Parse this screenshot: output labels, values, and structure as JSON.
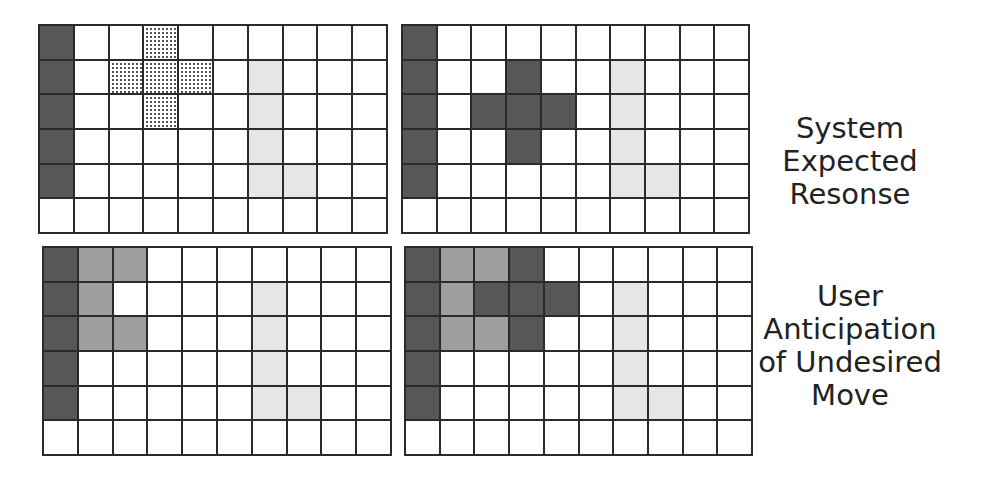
{
  "colors": {
    "grid_line": "#2a2a2a",
    "dark": "#575757",
    "medium": "#9e9e9e",
    "light": "#e6e6e6",
    "empty": "#ffffff"
  },
  "grid_size": {
    "cols": 10,
    "rows": 6
  },
  "grids": [
    {
      "id": "top-left",
      "description": "Initial state with dotted plus (expected target)",
      "cells": [
        [
          "dark",
          "empty",
          "empty",
          "dotted",
          "empty",
          "empty",
          "empty",
          "empty",
          "empty",
          "empty"
        ],
        [
          "dark",
          "empty",
          "dotted",
          "dotted",
          "dotted",
          "empty",
          "light",
          "empty",
          "empty",
          "empty"
        ],
        [
          "dark",
          "empty",
          "empty",
          "dotted",
          "empty",
          "empty",
          "light",
          "empty",
          "empty",
          "empty"
        ],
        [
          "dark",
          "empty",
          "empty",
          "empty",
          "empty",
          "empty",
          "light",
          "empty",
          "empty",
          "empty"
        ],
        [
          "dark",
          "empty",
          "empty",
          "empty",
          "empty",
          "empty",
          "light",
          "light",
          "empty",
          "empty"
        ],
        [
          "empty",
          "empty",
          "empty",
          "empty",
          "empty",
          "empty",
          "empty",
          "empty",
          "empty",
          "empty"
        ]
      ]
    },
    {
      "id": "top-right",
      "description": "System expected response: dark plus placed",
      "cells": [
        [
          "dark",
          "empty",
          "empty",
          "empty",
          "empty",
          "empty",
          "empty",
          "empty",
          "empty",
          "empty"
        ],
        [
          "dark",
          "empty",
          "empty",
          "dark",
          "empty",
          "empty",
          "light",
          "empty",
          "empty",
          "empty"
        ],
        [
          "dark",
          "empty",
          "dark",
          "dark",
          "dark",
          "empty",
          "light",
          "empty",
          "empty",
          "empty"
        ],
        [
          "dark",
          "empty",
          "empty",
          "dark",
          "empty",
          "empty",
          "light",
          "empty",
          "empty",
          "empty"
        ],
        [
          "dark",
          "empty",
          "empty",
          "empty",
          "empty",
          "empty",
          "light",
          "light",
          "empty",
          "empty"
        ],
        [
          "empty",
          "empty",
          "empty",
          "empty",
          "empty",
          "empty",
          "empty",
          "empty",
          "empty",
          "empty"
        ]
      ]
    },
    {
      "id": "bottom-left",
      "description": "User anticipation: medium cells near left column",
      "cells": [
        [
          "dark",
          "medium",
          "medium",
          "empty",
          "empty",
          "empty",
          "empty",
          "empty",
          "empty",
          "empty"
        ],
        [
          "dark",
          "medium",
          "empty",
          "empty",
          "empty",
          "empty",
          "light",
          "empty",
          "empty",
          "empty"
        ],
        [
          "dark",
          "medium",
          "medium",
          "empty",
          "empty",
          "empty",
          "light",
          "empty",
          "empty",
          "empty"
        ],
        [
          "dark",
          "empty",
          "empty",
          "empty",
          "empty",
          "empty",
          "light",
          "empty",
          "empty",
          "empty"
        ],
        [
          "dark",
          "empty",
          "empty",
          "empty",
          "empty",
          "empty",
          "light",
          "light",
          "empty",
          "empty"
        ],
        [
          "empty",
          "empty",
          "empty",
          "empty",
          "empty",
          "empty",
          "empty",
          "empty",
          "empty",
          "empty"
        ]
      ]
    },
    {
      "id": "bottom-right",
      "description": "Undesired move: plus merged with medium cells",
      "cells": [
        [
          "dark",
          "medium",
          "medium",
          "dark",
          "empty",
          "empty",
          "empty",
          "empty",
          "empty",
          "empty"
        ],
        [
          "dark",
          "medium",
          "dark",
          "dark",
          "dark",
          "empty",
          "light",
          "empty",
          "empty",
          "empty"
        ],
        [
          "dark",
          "medium",
          "medium",
          "dark",
          "empty",
          "empty",
          "light",
          "empty",
          "empty",
          "empty"
        ],
        [
          "dark",
          "empty",
          "empty",
          "empty",
          "empty",
          "empty",
          "light",
          "empty",
          "empty",
          "empty"
        ],
        [
          "dark",
          "empty",
          "empty",
          "empty",
          "empty",
          "empty",
          "light",
          "light",
          "empty",
          "empty"
        ],
        [
          "empty",
          "empty",
          "empty",
          "empty",
          "empty",
          "empty",
          "empty",
          "empty",
          "empty",
          "empty"
        ]
      ]
    }
  ],
  "labels": {
    "top": [
      "System",
      "Expected",
      "Resonse"
    ],
    "bottom": [
      "User",
      "Anticipation",
      "of Undesired",
      "Move"
    ]
  }
}
